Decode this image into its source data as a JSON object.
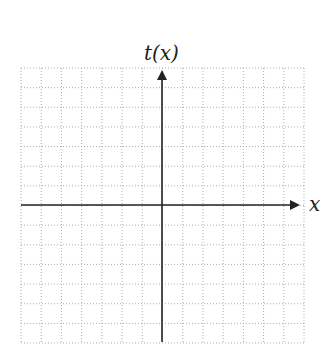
{
  "chart_data": {
    "type": "line",
    "title": "",
    "xlabel": "x",
    "ylabel": "t(x)",
    "series": [],
    "grid": true,
    "grid_style": "dotted",
    "grid_columns": 14,
    "grid_rows": 14,
    "x_ticks": [],
    "y_ticks": [],
    "axis_arrows": [
      "positive-x",
      "positive-y"
    ],
    "legend": null
  },
  "labels": {
    "y_axis": "t(x)",
    "x_axis": "x"
  },
  "colors": {
    "axis": "#222222",
    "grid": "#9a9a9a",
    "background": "#ffffff"
  }
}
